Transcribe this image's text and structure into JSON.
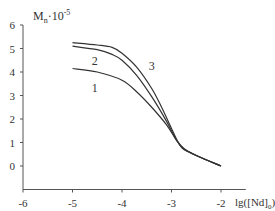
{
  "chart_data": {
    "type": "line",
    "title": "",
    "xlabel": "lg([Nd]0)",
    "ylabel": "Mn·10^-5",
    "xlim": [
      -6,
      -2
    ],
    "ylim": [
      -1,
      6
    ],
    "x_ticks": [
      -6,
      -5,
      -4,
      -3,
      -2
    ],
    "y_ticks": [
      0,
      1,
      2,
      3,
      4,
      5,
      6
    ],
    "grid": false,
    "legend": "inline curve labels",
    "series": [
      {
        "name": "1",
        "x": [
          -5.0,
          -4.5,
          -4.0,
          -3.7,
          -3.4,
          -3.1,
          -2.9,
          -2.75,
          -2.5,
          -2.0
        ],
        "y": [
          4.15,
          4.0,
          3.65,
          3.15,
          2.5,
          1.75,
          1.1,
          0.75,
          0.45,
          0.0
        ]
      },
      {
        "name": "2",
        "x": [
          -5.0,
          -4.5,
          -4.2,
          -4.0,
          -3.7,
          -3.4,
          -3.1,
          -2.9,
          -2.75,
          -2.5,
          -2.0
        ],
        "y": [
          5.1,
          4.95,
          4.75,
          4.5,
          3.85,
          2.95,
          1.9,
          1.1,
          0.72,
          0.45,
          0.0
        ]
      },
      {
        "name": "3",
        "x": [
          -5.0,
          -4.5,
          -4.2,
          -4.0,
          -3.7,
          -3.4,
          -3.2,
          -3.0,
          -2.85,
          -2.75,
          -2.5,
          -2.0
        ],
        "y": [
          5.25,
          5.15,
          5.05,
          4.8,
          4.2,
          3.3,
          2.5,
          1.6,
          0.95,
          0.7,
          0.45,
          0.0
        ]
      }
    ]
  },
  "labels": {
    "y_axis_main": "M",
    "y_axis_sub": "n",
    "y_axis_suffix": "·10",
    "y_axis_exp": "-5",
    "x_axis_main": "lg([Nd]",
    "x_axis_sub": "0",
    "x_axis_close": ")",
    "curve_labels": [
      {
        "text": "1",
        "x": -4.55,
        "y": 3.15
      },
      {
        "text": "2",
        "x": -4.55,
        "y": 4.3
      },
      {
        "text": "3",
        "x": -3.4,
        "y": 4.1
      }
    ]
  }
}
